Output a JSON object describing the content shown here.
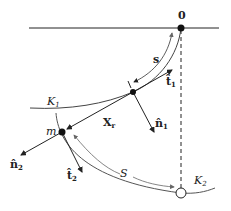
{
  "diagram": {
    "labels": {
      "origin": "0",
      "arc_s": "s",
      "t1": "t̂",
      "t1_sub": "1",
      "n1": "n̂",
      "n1_sub": "1",
      "k1": "K",
      "k1_sub": "1",
      "xr": "X",
      "xr_sub": "r",
      "m": "m",
      "n2": "n̂",
      "n2_sub": "2",
      "t2": "t̂",
      "t2_sub": "2",
      "arc_S": "S",
      "k2": "K",
      "k2_sub": "2"
    },
    "colors": {
      "line": "#222222",
      "arc": "#777777",
      "background": "#ffffff"
    }
  }
}
